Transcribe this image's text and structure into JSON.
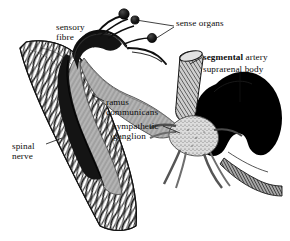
{
  "figure": {
    "background_color": "#ffffff",
    "ink_color": "#101010",
    "width": 290,
    "height": 241
  },
  "labels": {
    "sensory_fibre": {
      "line1": "sensory",
      "line2": "fibre"
    },
    "sense_organs": {
      "text": "sense organs"
    },
    "segmental_artery": {
      "emphasis": "segmental",
      "rest": "artery"
    },
    "suprarenal_body": {
      "text": "suprarenal body"
    },
    "ramus_communicans": {
      "line1": "ramus",
      "line2": "communicans"
    },
    "sympathetic_ganglion": {
      "line1": "sympathetic",
      "line2": "ganglion"
    },
    "spinal_nerve": {
      "line1": "spinal",
      "line2": "nerve"
    }
  },
  "structures": {
    "spinal_nerve": {
      "name": "spinal-nerve",
      "description": "broad striated nerve trunk running diagonally down the left side",
      "fill": "#ffffff",
      "stroke": "#101010"
    },
    "sensory_fibre": {
      "name": "sensory-fibre",
      "description": "thick dark fibre arching from the spinal nerve up to the sense organs",
      "fill": "#141414"
    },
    "sense_organs": {
      "name": "sense-organs",
      "description": "three dark rounded nodules on branching stalks at the top",
      "count": 3,
      "fill": "#1c1c1c"
    },
    "ramus_communicans": {
      "name": "ramus-communicans",
      "description": "grey striated band sweeping right from the sensory fibre to the ganglion",
      "fill": "#b9b9b9"
    },
    "sympathetic_ganglion": {
      "name": "sympathetic-ganglion",
      "description": "pale stippled star-shaped ganglion with radiating branches",
      "fill": "#d2d2d2"
    },
    "segmental_artery": {
      "name": "segmental-artery",
      "description": "cross-hatched cylindrical vessel descending from upper right",
      "fill": "#9a9a9a"
    },
    "suprarenal_body": {
      "name": "suprarenal-body",
      "description": "solid black kidney-shaped mass right of the ganglion",
      "fill": "#000000"
    }
  }
}
